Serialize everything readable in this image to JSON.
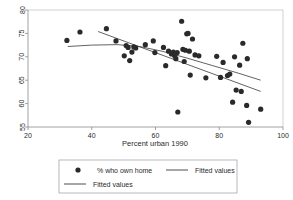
{
  "chart_data": {
    "type": "scatter",
    "title": "",
    "xlabel": "Percent urban 1990",
    "ylabel": "",
    "xlim": [
      20,
      100
    ],
    "ylim": [
      55,
      80
    ],
    "xticks": [
      20,
      40,
      60,
      80,
      100
    ],
    "yticks": [
      55,
      60,
      65,
      70,
      75,
      80
    ],
    "grid": false,
    "legend_position": "bottom-outside",
    "series": [
      {
        "name": "% who own home",
        "type": "scatter",
        "marker": "filled-circle",
        "color": "#2a2a2a",
        "points": [
          [
            32.2,
            73.5
          ],
          [
            36.3,
            75.3
          ],
          [
            44.6,
            76.0
          ],
          [
            47.6,
            73.4
          ],
          [
            50.2,
            70.2
          ],
          [
            50.8,
            72.4
          ],
          [
            51.4,
            72.0
          ],
          [
            51.9,
            69.2
          ],
          [
            52.6,
            71.0
          ],
          [
            53.2,
            72.1
          ],
          [
            53.8,
            71.9
          ],
          [
            56.8,
            72.6
          ],
          [
            59.3,
            73.4
          ],
          [
            59.8,
            70.9
          ],
          [
            62.5,
            72.0
          ],
          [
            63.2,
            68.1
          ],
          [
            64.1,
            71.2
          ],
          [
            65.0,
            70.6
          ],
          [
            65.6,
            71.0
          ],
          [
            66.0,
            70.2
          ],
          [
            66.4,
            69.6
          ],
          [
            66.8,
            70.9
          ],
          [
            67.0,
            58.2
          ],
          [
            68.2,
            77.6
          ],
          [
            68.6,
            71.6
          ],
          [
            69.0,
            69.0
          ],
          [
            69.4,
            71.4
          ],
          [
            69.8,
            74.9
          ],
          [
            70.2,
            75.0
          ],
          [
            70.6,
            71.2
          ],
          [
            70.9,
            66.1
          ],
          [
            71.6,
            73.8
          ],
          [
            72.4,
            70.4
          ],
          [
            73.6,
            70.2
          ],
          [
            75.8,
            65.5
          ],
          [
            79.2,
            70.1
          ],
          [
            80.4,
            65.6
          ],
          [
            81.2,
            68.8
          ],
          [
            82.6,
            66.0
          ],
          [
            83.3,
            66.3
          ],
          [
            84.2,
            60.3
          ],
          [
            84.8,
            70.0
          ],
          [
            85.3,
            62.9
          ],
          [
            86.4,
            68.2
          ],
          [
            86.9,
            62.6
          ],
          [
            87.4,
            72.9
          ],
          [
            88.6,
            59.6
          ],
          [
            88.8,
            69.6
          ],
          [
            89.2,
            56.0
          ],
          [
            93.0,
            58.8
          ]
        ]
      },
      {
        "name": "Fitted values",
        "type": "line",
        "color": "#3a3a3a",
        "points": [
          [
            42.0,
            75.4
          ],
          [
            93.0,
            62.6
          ]
        ]
      },
      {
        "name": "Fitted values",
        "type": "line",
        "color": "#3a3a3a",
        "points": [
          [
            32.5,
            72.2
          ],
          [
            40.0,
            72.5
          ],
          [
            48.0,
            72.6
          ],
          [
            55.0,
            72.2
          ],
          [
            62.0,
            71.2
          ],
          [
            70.0,
            69.7
          ],
          [
            78.0,
            68.1
          ],
          [
            86.0,
            66.5
          ],
          [
            93.0,
            65.0
          ]
        ]
      }
    ]
  },
  "legend": {
    "entries": [
      {
        "label": "% who own home",
        "symbol": "marker"
      },
      {
        "label": "Fitted values",
        "symbol": "line"
      },
      {
        "label": "Fitted values",
        "symbol": "line"
      }
    ]
  }
}
